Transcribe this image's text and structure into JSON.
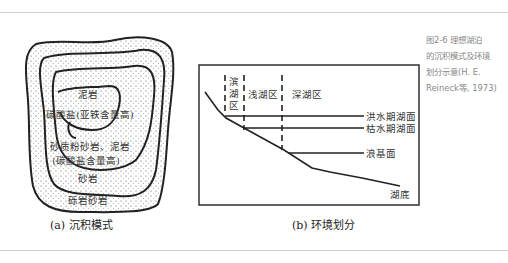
{
  "figure": {
    "caption_side": {
      "line1": "图2-6  理想湖泊",
      "line2": "的沉积模式及环境",
      "line3": "划分示意(H. E.",
      "line4": "Reineck等, 1973)"
    },
    "panel_a": {
      "caption": "(a) 沉积模式",
      "labels": {
        "mudstone": "泥岩",
        "carbonate_fe": "碳酸盐(亚铁含量高)",
        "sandy_silt": "砂质粉砂岩、泥岩",
        "carbonate_high": "(碳酸盐含量高)",
        "sandstone": "砂岩",
        "conglomerate": "砾岩砂岩"
      }
    },
    "panel_b": {
      "caption": "(b) 环境划分",
      "zones": {
        "shore_1": "滨",
        "shore_2": "湖",
        "shore_3": "区",
        "shallow": "浅湖区",
        "deep": "深湖区"
      },
      "levels": {
        "flood": "洪水期湖面",
        "dry": "枯水期湖面",
        "wave_base": "浪基面",
        "bottom": "湖底"
      }
    }
  }
}
